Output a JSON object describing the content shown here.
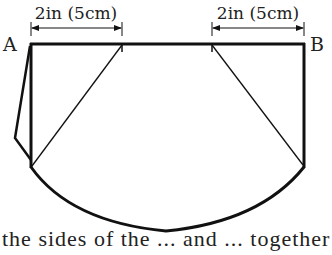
{
  "diagram": {
    "dimension_left": {
      "label": "2in (5cm)"
    },
    "dimension_right": {
      "label": "2in (5cm)"
    },
    "point_a": "A",
    "point_b": "B",
    "colors": {
      "stroke": "#111111",
      "text": "#222222",
      "background": "#ffffff"
    }
  },
  "caption": {
    "partial_text": "the sides of the ... and ... together"
  }
}
